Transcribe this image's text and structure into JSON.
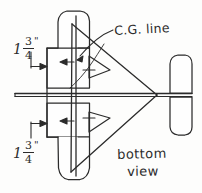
{
  "figure": {
    "kind": "hand-drawn model aircraft plan, bottom view",
    "title": "",
    "background_color": "#fdfdfc",
    "ink_color": "#2b2b2b"
  },
  "annotations": {
    "cg_line_label": "C.G. line",
    "view_label_line1": "bottom",
    "view_label_line2": "view"
  },
  "dimensions": [
    {
      "name": "upper-wing-offset",
      "whole": "1",
      "numerator": "3",
      "denominator": "4",
      "unit": "\""
    },
    {
      "name": "lower-wing-offset",
      "whole": "1",
      "numerator": "3",
      "denominator": "4",
      "unit": "\""
    }
  ],
  "parts": {
    "wing": "wing-planform",
    "fuselage_rod": "fuselage-rod",
    "delta_body": "delta-body",
    "tail": "tail-surface",
    "cg_line": "cg-vertical-line"
  }
}
